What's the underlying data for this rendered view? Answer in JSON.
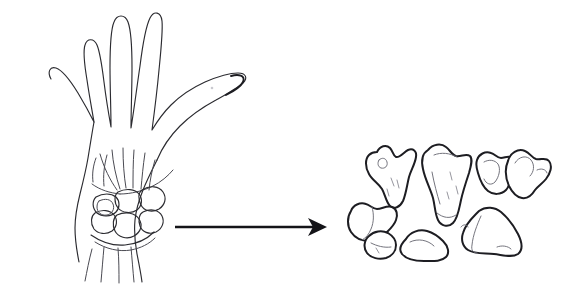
{
  "figure": {
    "type": "line-drawing",
    "background_color": "#ffffff",
    "ink_color": "#2b2b30",
    "canvas": {
      "width": 572,
      "height": 297
    }
  },
  "left_panel": {
    "name": "hand-drawing",
    "description": "Outline line drawing of an open left hand, palm view, four fingers extended upward and thumb extended to the right, with metacarpal and carpal bones sketched at the wrist and the forearm tapering below",
    "parts": [
      {
        "name": "index-finger",
        "label": "Index finger"
      },
      {
        "name": "middle-finger",
        "label": "Middle finger"
      },
      {
        "name": "ring-finger",
        "label": "Ring finger"
      },
      {
        "name": "little-finger",
        "label": "Little finger"
      },
      {
        "name": "thumb",
        "label": "Thumb"
      },
      {
        "name": "palm",
        "label": "Palm"
      },
      {
        "name": "metacarpals",
        "label": "Metacarpals"
      },
      {
        "name": "carpus",
        "label": "Carpus"
      },
      {
        "name": "forearm",
        "label": "Forearm"
      }
    ]
  },
  "arrow": {
    "name": "transformation-arrow",
    "direction": "right",
    "label": "",
    "start_x": 175,
    "end_x": 325,
    "y": 227,
    "color": "#141418"
  },
  "right_panel": {
    "name": "carpal-bones-cluster",
    "description": "Eight separated carpal bones drawn as individual irregular outlines scattered in a loose cluster",
    "bone_count": 8,
    "bones": [
      {
        "name": "bone-scaphoid",
        "label": "",
        "position": "upper-left"
      },
      {
        "name": "bone-lunate",
        "label": "",
        "position": "upper-center"
      },
      {
        "name": "bone-triquetrum",
        "label": "",
        "position": "upper-right"
      },
      {
        "name": "bone-pisiform",
        "label": "",
        "position": "far-upper-right"
      },
      {
        "name": "bone-trapezium",
        "label": "",
        "position": "left"
      },
      {
        "name": "bone-trapezoid",
        "label": "",
        "position": "lower-left"
      },
      {
        "name": "bone-capitate",
        "label": "",
        "position": "lower-center"
      },
      {
        "name": "bone-hamate",
        "label": "",
        "position": "lower-right"
      }
    ]
  }
}
